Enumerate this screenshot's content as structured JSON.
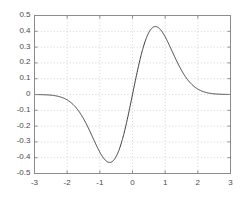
{
  "chart_data": {
    "type": "line",
    "title": "",
    "subtitle": "",
    "xlabel": "",
    "ylabel": "",
    "xlim": [
      -3,
      3
    ],
    "ylim": [
      -0.5,
      0.5
    ],
    "xticks": [
      -3,
      -2,
      -1,
      0,
      1,
      2,
      3
    ],
    "yticks": [
      -0.5,
      -0.4,
      -0.3,
      -0.2,
      -0.1,
      0,
      0.1,
      0.2,
      0.3,
      0.4,
      0.5
    ],
    "xtick_labels": [
      "-3",
      "-2",
      "-1",
      "0",
      "1",
      "2",
      "3"
    ],
    "ytick_labels": [
      "-0.5",
      "-0.4",
      "-0.3",
      "-0.2",
      "-0.1",
      "0",
      "0.1",
      "0.2",
      "0.3",
      "0.4",
      "0.5"
    ],
    "grid": true,
    "grid_style": "dotted",
    "legend": null,
    "legend_position": "none",
    "annotations": [],
    "series": [
      {
        "name": "wavelet",
        "color": "#3c3c3c",
        "line_width": 1.0,
        "x": [
          -3.0,
          -2.9,
          -2.8,
          -2.7,
          -2.6,
          -2.5,
          -2.4,
          -2.3,
          -2.2,
          -2.1,
          -2.0,
          -1.9,
          -1.8,
          -1.7,
          -1.6,
          -1.5,
          -1.4,
          -1.3,
          -1.2,
          -1.1,
          -1.0,
          -0.9,
          -0.8,
          -0.7,
          -0.6,
          -0.5,
          -0.4,
          -0.3,
          -0.2,
          -0.1,
          0.0,
          0.1,
          0.2,
          0.3,
          0.4,
          0.5,
          0.6,
          0.7,
          0.8,
          0.9,
          1.0,
          1.1,
          1.2,
          1.3,
          1.4,
          1.5,
          1.6,
          1.7,
          1.8,
          1.9,
          2.0,
          2.1,
          2.2,
          2.3,
          2.4,
          2.5,
          2.6,
          2.7,
          2.8,
          2.9,
          3.0
        ],
        "y": [
          -0.0004,
          -0.0007,
          -0.0011,
          -0.0017,
          -0.0026,
          -0.0039,
          -0.0058,
          -0.0085,
          -0.0122,
          -0.0172,
          -0.0239,
          -0.0326,
          -0.0436,
          -0.0572,
          -0.0735,
          -0.0926,
          -0.1142,
          -0.1379,
          -0.1631,
          -0.1888,
          -0.2139,
          -0.2371,
          -0.2571,
          -0.2726,
          -0.2824,
          -0.2858,
          -0.2823,
          -0.272,
          -0.2554,
          -0.2334,
          0.0,
          0.2334,
          0.2554,
          0.272,
          0.2823,
          0.2858,
          0.2824,
          0.2726,
          0.2571,
          0.2371,
          0.2139,
          0.1888,
          0.1631,
          0.1379,
          0.1142,
          0.0926,
          0.0735,
          0.0572,
          0.0436,
          0.0326,
          0.0239,
          0.0172,
          0.0122,
          0.0085,
          0.0058,
          0.0039,
          0.0026,
          0.0017,
          0.0011,
          0.0007,
          0.0004
        ],
        "min_value": -0.43,
        "min_at_x": -0.7,
        "max_value": 0.43,
        "max_at_x": 0.7,
        "zero_crossing_x": 0.0
      }
    ]
  },
  "style": {
    "background": "#ffffff",
    "axis_color": "#8c8c8c",
    "grid_color": "#c8c8c8",
    "tick_label_color": "#4a4a4a",
    "curve_color": "#3c3c3c"
  }
}
